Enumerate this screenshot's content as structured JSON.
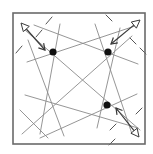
{
  "diagram": {
    "title": "",
    "colors": {
      "frame": "#6a6a6a",
      "lines": "#8a8a8a",
      "dots": "#111111",
      "arrows": "#3a3a3a",
      "background": "#ffffff"
    },
    "frame": {
      "x": 13,
      "y": 13,
      "width": 132,
      "height": 131
    },
    "dots": [
      {
        "name": "dot-top-left",
        "x": 53,
        "y": 52,
        "r": 3.6
      },
      {
        "name": "dot-top-right",
        "x": 108,
        "y": 52,
        "r": 3.6
      },
      {
        "name": "dot-bottom-right",
        "x": 107,
        "y": 105,
        "r": 3.6
      }
    ],
    "lines": [
      {
        "x1": 25,
        "y1": 30,
        "x2": 140,
        "y2": 130
      },
      {
        "x1": 34,
        "y1": 25,
        "x2": 138,
        "y2": 64
      },
      {
        "x1": 27,
        "y1": 62,
        "x2": 135,
        "y2": 26
      },
      {
        "x1": 60,
        "y1": 24,
        "x2": 40,
        "y2": 134
      },
      {
        "x1": 28,
        "y1": 40,
        "x2": 64,
        "y2": 136
      },
      {
        "x1": 95,
        "y1": 24,
        "x2": 132,
        "y2": 134
      },
      {
        "x1": 120,
        "y1": 28,
        "x2": 97,
        "y2": 128
      },
      {
        "x1": 132,
        "y1": 36,
        "x2": 22,
        "y2": 134
      },
      {
        "x1": 25,
        "y1": 95,
        "x2": 138,
        "y2": 128
      },
      {
        "x1": 40,
        "y1": 138,
        "x2": 137,
        "y2": 94
      },
      {
        "x1": 20,
        "y1": 110,
        "x2": 48,
        "y2": 138
      }
    ],
    "dashes": [
      {
        "x1": 52,
        "y1": 17,
        "x2": 46,
        "y2": 24
      },
      {
        "x1": 42,
        "y1": 30,
        "x2": 36,
        "y2": 37
      },
      {
        "x1": 22,
        "y1": 46,
        "x2": 16,
        "y2": 53
      },
      {
        "x1": 106,
        "y1": 15,
        "x2": 112,
        "y2": 21
      },
      {
        "x1": 130,
        "y1": 38,
        "x2": 136,
        "y2": 44
      },
      {
        "x1": 140,
        "y1": 48,
        "x2": 146,
        "y2": 54
      },
      {
        "x1": 142,
        "y1": 108,
        "x2": 136,
        "y2": 114
      },
      {
        "x1": 116,
        "y1": 124,
        "x2": 110,
        "y2": 130
      },
      {
        "x1": 115,
        "y1": 139,
        "x2": 109,
        "y2": 145
      }
    ],
    "arrows": [
      {
        "name": "arrow-top-left",
        "x1": 21,
        "y1": 23,
        "x2": 45,
        "y2": 50,
        "open_end": "start"
      },
      {
        "name": "arrow-top-right",
        "x1": 140,
        "y1": 20,
        "x2": 111,
        "y2": 44,
        "open_end": "start"
      },
      {
        "name": "arrow-bottom-right",
        "x1": 139,
        "y1": 137,
        "x2": 116,
        "y2": 108,
        "open_end": "start"
      }
    ]
  }
}
